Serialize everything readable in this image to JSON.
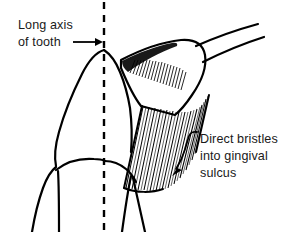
{
  "figure": {
    "background_color": "#ffffff",
    "ink_color": "#000000",
    "width": 290,
    "height": 232
  },
  "labels": {
    "long_axis": {
      "line1": "Long axis",
      "line2": "of tooth"
    },
    "direct_bristles": {
      "line1": "Direct bristles",
      "line2": "into gingival",
      "line3": "sulcus"
    }
  },
  "annotations": {
    "long_axis_arrow": "straight-arrow-right",
    "direct_bristles_arrow": "curved-arrow-down-left",
    "axis_line_style": "dashed-vertical"
  }
}
